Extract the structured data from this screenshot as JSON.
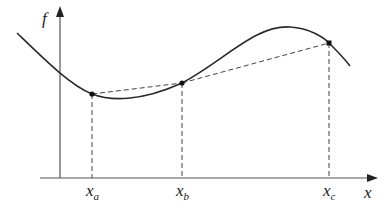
{
  "diagram": {
    "y_axis_label": "f",
    "x_axis_label": "x",
    "points": [
      {
        "name": "x",
        "sub": "a"
      },
      {
        "name": "x",
        "sub": "b"
      },
      {
        "name": "x",
        "sub": "c"
      }
    ],
    "colors": {
      "curve": "#2a2a2a",
      "axis": "#555555",
      "dash": "#444444"
    }
  }
}
